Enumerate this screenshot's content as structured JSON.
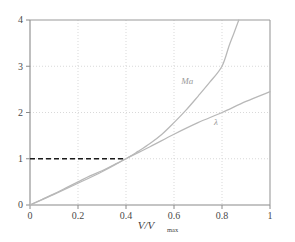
{
  "chart_data": {
    "type": "line",
    "title": "",
    "subtitle": "",
    "xlabel": "V/Vmax",
    "xlabel_main": "V/V",
    "xlabel_sub": "max",
    "ylabel": "",
    "xlim": [
      0,
      1
    ],
    "ylim": [
      0,
      4
    ],
    "grid": true,
    "grid_style": "dotted",
    "legend_position": "inline-annotations",
    "xticks": [
      0,
      0.2,
      0.4,
      0.6,
      0.8,
      1
    ],
    "xtick_labels": [
      "0",
      "0.2",
      "0.4",
      "0.6",
      "0.8",
      "1"
    ],
    "yticks": [
      0,
      1,
      2,
      3,
      4
    ],
    "ytick_labels": [
      "0",
      "1",
      "2",
      "3",
      "4"
    ],
    "series": [
      {
        "name": "Ma",
        "label": "Ma",
        "color": "#b8b8b8",
        "style": "solid",
        "x": [
          0.0,
          0.05,
          0.1,
          0.15,
          0.2,
          0.25,
          0.3,
          0.35,
          0.4,
          0.45,
          0.5,
          0.55,
          0.6,
          0.65,
          0.7,
          0.75,
          0.8,
          0.83,
          0.85,
          0.87
        ],
        "values": [
          0.0,
          0.12,
          0.24,
          0.37,
          0.5,
          0.63,
          0.74,
          0.87,
          1.0,
          1.16,
          1.33,
          1.53,
          1.78,
          2.05,
          2.35,
          2.66,
          3.0,
          3.45,
          3.72,
          4.0
        ]
      },
      {
        "name": "lambda",
        "label": "λ",
        "color": "#b8b8b8",
        "style": "solid",
        "x": [
          0.0,
          0.1,
          0.2,
          0.3,
          0.4,
          0.5,
          0.6,
          0.7,
          0.8,
          0.9,
          1.0
        ],
        "values": [
          0.0,
          0.23,
          0.47,
          0.72,
          1.0,
          1.26,
          1.53,
          1.78,
          2.0,
          2.24,
          2.45
        ]
      }
    ],
    "annotations": [
      {
        "name": "ma-curve-label",
        "text": "Ma",
        "x": 0.655,
        "y": 2.62
      },
      {
        "name": "lambda-curve-label",
        "text": "λ",
        "x": 0.775,
        "y": 1.72
      }
    ],
    "reference_lines": [
      {
        "name": "unity-reference-line",
        "orientation": "horizontal",
        "y": 1,
        "x_from": 0,
        "x_to": 0.4,
        "style": "dashed",
        "color": "#1a1a1a"
      }
    ],
    "axis_color": "#8a8a8a",
    "grid_color": "#cfcfcf",
    "background": "#ffffff"
  }
}
